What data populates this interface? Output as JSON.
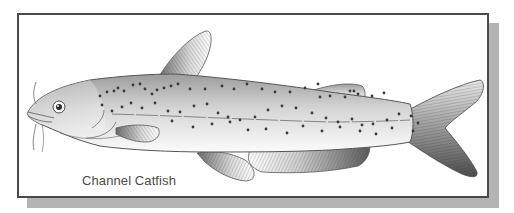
{
  "figure": {
    "caption": "Channel Catfish"
  },
  "colors": {
    "frame_border": "#4a4a4a",
    "shadow": "#b4b4b4",
    "outline": "#5a5a5a",
    "body_dark": "#9a9a9a",
    "body_light": "#f2f2f2",
    "spot": "#3a3a3a",
    "caption_text": "#4a4a4a"
  },
  "spots": [
    [
      100,
      96
    ],
    [
      107,
      92
    ],
    [
      114,
      91
    ],
    [
      118,
      88
    ],
    [
      124,
      91
    ],
    [
      133,
      85
    ],
    [
      140,
      84
    ],
    [
      145,
      89
    ],
    [
      152,
      94
    ],
    [
      157,
      90
    ],
    [
      164,
      88
    ],
    [
      171,
      86
    ],
    [
      178,
      84
    ],
    [
      190,
      89
    ],
    [
      205,
      89
    ],
    [
      222,
      86
    ],
    [
      234,
      89
    ],
    [
      247,
      84
    ],
    [
      262,
      89
    ],
    [
      275,
      92
    ],
    [
      290,
      92
    ],
    [
      305,
      88
    ],
    [
      318,
      84
    ],
    [
      320,
      97
    ],
    [
      330,
      96
    ],
    [
      345,
      97
    ],
    [
      358,
      94
    ],
    [
      372,
      96
    ],
    [
      384,
      93
    ],
    [
      102,
      105
    ],
    [
      112,
      111
    ],
    [
      122,
      107
    ],
    [
      131,
      103
    ],
    [
      142,
      108
    ],
    [
      155,
      103
    ],
    [
      168,
      111
    ],
    [
      180,
      112
    ],
    [
      194,
      106
    ],
    [
      207,
      104
    ],
    [
      218,
      113
    ],
    [
      228,
      117
    ],
    [
      240,
      120
    ],
    [
      255,
      117
    ],
    [
      268,
      110
    ],
    [
      282,
      106
    ],
    [
      296,
      108
    ],
    [
      312,
      113
    ],
    [
      326,
      118
    ],
    [
      338,
      122
    ],
    [
      352,
      119
    ],
    [
      362,
      125
    ],
    [
      373,
      124
    ],
    [
      387,
      120
    ],
    [
      399,
      114
    ],
    [
      411,
      116
    ],
    [
      418,
      123
    ],
    [
      172,
      121
    ],
    [
      193,
      127
    ],
    [
      212,
      124
    ],
    [
      230,
      122
    ],
    [
      248,
      130
    ],
    [
      266,
      129
    ],
    [
      287,
      133
    ],
    [
      303,
      126
    ],
    [
      322,
      131
    ],
    [
      340,
      127
    ],
    [
      360,
      131
    ],
    [
      376,
      134
    ],
    [
      392,
      128
    ],
    [
      413,
      131
    ],
    [
      350,
      91
    ],
    [
      354,
      91
    ]
  ]
}
